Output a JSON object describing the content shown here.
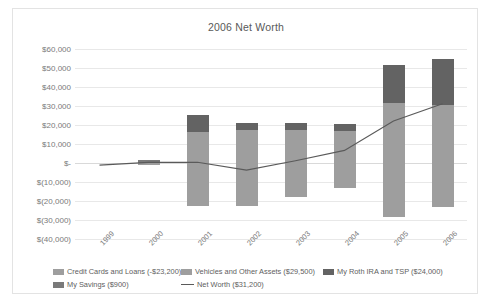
{
  "chart_data": {
    "type": "bar",
    "title": "2006 Net Worth",
    "xlabel": "",
    "ylabel": "",
    "ylim": [
      -40000,
      60000
    ],
    "ytick_step": 10000,
    "grid": true,
    "legend_position": "bottom",
    "stacked": true,
    "categories": [
      "1999",
      "2000",
      "2001",
      "2002",
      "2003",
      "2004",
      "2005",
      "2006"
    ],
    "ytick_labels": [
      "$60,000",
      "$50,000",
      "$40,000",
      "$30,000",
      "$20,000",
      "$10,000",
      "$-",
      "$(10,000)",
      "$(20,000)",
      "$(30,000)",
      "$(40,000)"
    ],
    "series": [
      {
        "name": "Credit Cards and Loans (-$23,200)",
        "color": "#9e9e9e",
        "values": [
          0,
          -1200,
          -22800,
          -22600,
          -17900,
          -13200,
          -28600,
          -23200
        ]
      },
      {
        "name": "Vehicles and Other Assets ($29,500)",
        "color": "#9e9e9e",
        "values": [
          0,
          0,
          16500,
          17200,
          17400,
          17000,
          31400,
          30300
        ]
      },
      {
        "name": "My Roth IRA and TSP ($24,000)",
        "color": "#636363",
        "values": [
          0,
          0,
          8900,
          3600,
          3700,
          3600,
          20100,
          24700
        ]
      },
      {
        "name": "My Savings ($900)",
        "color": "#7a7a7a",
        "values": [
          0,
          1400,
          0,
          0,
          0,
          0,
          0,
          0
        ]
      }
    ],
    "line_series": {
      "name": "Net Worth ($31,200)",
      "color": "#5a5a5a",
      "values": [
        -1100,
        300,
        400,
        -3700,
        1200,
        6600,
        22100,
        31200
      ]
    }
  },
  "legend": {
    "items": [
      {
        "label": "Credit Cards and Loans (-$23,200)",
        "type": "swatch"
      },
      {
        "label": "Vehicles and Other Assets ($29,500)",
        "type": "swatch"
      },
      {
        "label": "My Roth IRA and TSP ($24,000)",
        "type": "swatch"
      },
      {
        "label": "My Savings ($900)",
        "type": "swatch"
      },
      {
        "label": "Net Worth ($31,200)",
        "type": "line"
      }
    ]
  }
}
